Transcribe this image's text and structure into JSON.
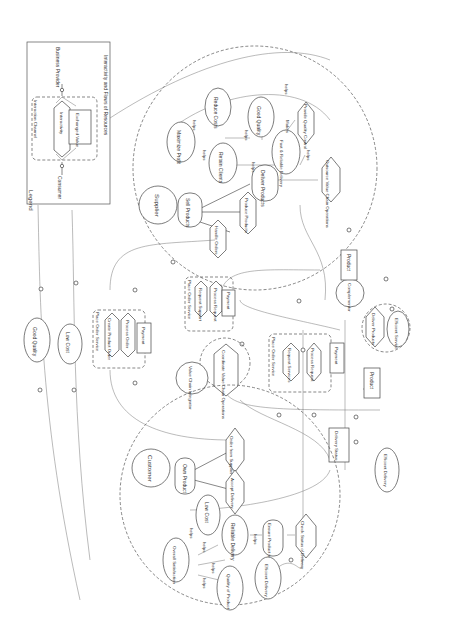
{
  "legend": {
    "title": "Legend",
    "consumer": "Consumer",
    "provider": "Business Provider",
    "channel": "Interaction Channel",
    "interactivity": "Interactivity",
    "value": "Exchanged Value",
    "caption": "Interactivity and Flows of Resources"
  },
  "actors": {
    "supplier": "Supplier",
    "customer": "Customer",
    "integrator": "Value Chain Integrator",
    "complementor": "Complementor"
  },
  "supplier": {
    "maximize_profit": "Maximize Profit",
    "reduce_costs": "Reduce Costs",
    "retain_clients": "Retain Clients",
    "good_quality": "Good Quality",
    "fast_reliable": "Fast & Reliable Delivery",
    "provide_qc": "Provide Quality Control",
    "outsource": "Outsource Value Chain Operations",
    "deliver_products": "Deliver Products",
    "produce_products": "Produce Products",
    "sell_products": "Sell Products",
    "handle_orders": "Handle Orders"
  },
  "links": {
    "helps": "helps",
    "makes": "Makes"
  },
  "services": {
    "pos_title": "Place Order Service",
    "request_support": "Request Support",
    "process_request": "Process Request",
    "payment": "Payment",
    "create_order": "Create Product Order",
    "process_order": "Process Order",
    "request_services": "Request Services"
  },
  "integrator": {
    "coordinate": "Coordinate Value Chain Operations"
  },
  "complementor": {
    "deliver_products": "Deliver Products",
    "efficient_service": "Efficient Service"
  },
  "customer": {
    "own_product": "Own Product",
    "order_from_supplier": "Order from Supplier",
    "accept_delivery": "Accept Delivery",
    "low_cost": "Low Cost",
    "reliable_delivery": "Reliable Delivery",
    "overall_satisfaction": "Overall Satisfaction",
    "ensure_on_way": "Ensure Product is On-the-way",
    "check_status": "Check Status of Delivery",
    "efficient_delivery": "Efficient Delivery",
    "quality_of_product": "Quality of Product"
  },
  "resources": {
    "product_1": "Product",
    "product_2": "Product",
    "delivery_status": "Delivery Status"
  },
  "softgoals": {
    "good_quality": "Good Quality",
    "low_cost": "Low Cost",
    "efficient_delivery": "Efficient Delivery"
  }
}
